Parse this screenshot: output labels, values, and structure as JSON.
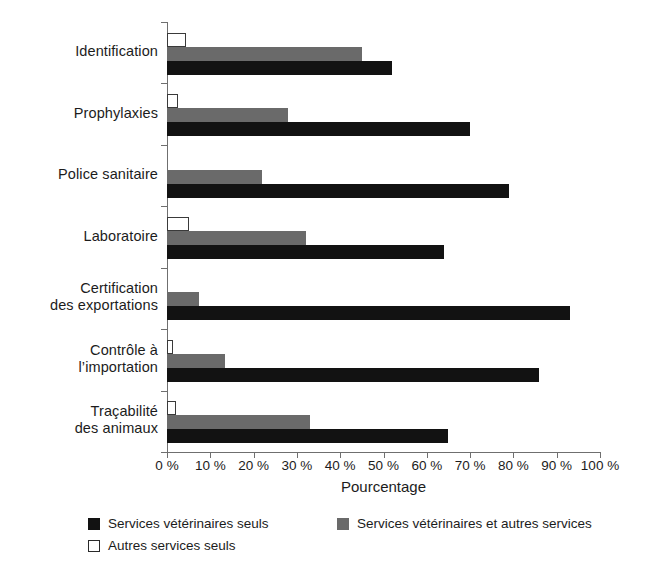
{
  "chart_data": {
    "type": "bar",
    "orientation": "horizontal",
    "title": "",
    "xlabel": "Pourcentage",
    "ylabel": "",
    "xlim": [
      0,
      100
    ],
    "grid": false,
    "legend_position": "bottom-left",
    "xtick_labels": [
      "0 %",
      "10 %",
      "20 %",
      "30 %",
      "40 %",
      "50 %",
      "60 %",
      "70 %",
      "80 %",
      "90 %",
      "100 %"
    ],
    "xtick_values": [
      0,
      10,
      20,
      30,
      40,
      50,
      60,
      70,
      80,
      90,
      100
    ],
    "categories": [
      "Identification",
      "Prophylaxies",
      "Police sanitaire",
      "Laboratoire",
      "Certification\ndes exportations",
      "Contrôle à\nl’importation",
      "Traçabilité\ndes animaux"
    ],
    "series": [
      {
        "name": "Services vétérinaires seuls",
        "color": "#121212",
        "swatch": "sw-black",
        "style": "s-black",
        "values": [
          52,
          70,
          79,
          64,
          93,
          86,
          65
        ]
      },
      {
        "name": "Services vétérinaires et autres services",
        "color": "#6a6a6a",
        "swatch": "sw-gray",
        "style": "s-gray",
        "values": [
          45,
          28,
          22,
          32,
          7.5,
          13.5,
          33
        ]
      },
      {
        "name": "Autres services seuls",
        "color": "#ffffff",
        "swatch": "sw-white",
        "style": "s-white",
        "values": [
          4.5,
          2.5,
          0,
          5,
          0,
          1.5,
          2
        ]
      }
    ]
  },
  "axis": {
    "x_title": "Pourcentage"
  },
  "legend": {
    "items": [
      {
        "label": "Services vétérinaires seuls",
        "swatch": "sw-black"
      },
      {
        "label": "Services vétérinaires et autres services",
        "swatch": "sw-gray"
      },
      {
        "label": "Autres services seuls",
        "swatch": "sw-white"
      }
    ]
  }
}
